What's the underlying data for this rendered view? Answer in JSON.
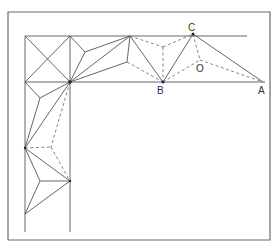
{
  "diagram": {
    "labels": {
      "A": "A",
      "B": "B",
      "C": "C",
      "O": "O"
    },
    "points": {
      "A": [
        263,
        82
      ],
      "B": [
        163,
        82
      ],
      "C": [
        193,
        34
      ],
      "O": [
        200,
        60
      ]
    },
    "colors": {
      "line": "#555555",
      "frame": "#6a6a6a",
      "background": "#ffffff"
    }
  }
}
